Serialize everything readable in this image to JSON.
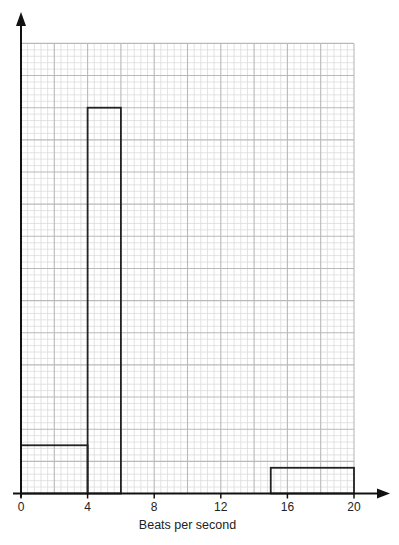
{
  "chart_data": {
    "type": "bar",
    "subtype": "histogram",
    "title": "",
    "xlabel": "Beats per second",
    "ylabel": "",
    "x_ticks": [
      0,
      4,
      8,
      12,
      16,
      20
    ],
    "xlim": [
      0,
      20
    ],
    "ylim_big_squares": [
      0,
      14
    ],
    "y_axis_labelled": false,
    "grid": {
      "on": true,
      "major_x_step": 2,
      "minor_per_major": 5,
      "major_rows": 14,
      "major_color": "#b9b9b9",
      "minor_color": "#dcdcdc"
    },
    "bars": [
      {
        "x_start": 0,
        "x_end": 4,
        "height": 1.5
      },
      {
        "x_start": 4,
        "x_end": 6,
        "height": 12
      },
      {
        "x_start": 15,
        "x_end": 20,
        "height": 0.8
      }
    ],
    "height_unit": "big grid squares (unlabelled y-axis, frequency density)",
    "legend": null
  },
  "colors": {
    "axis": "#111111",
    "bar_outline": "#222222",
    "background": "#ffffff"
  }
}
